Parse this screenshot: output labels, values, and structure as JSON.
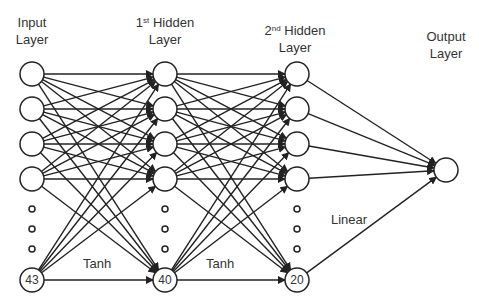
{
  "diagram": {
    "type": "feedforward-neural-network",
    "layers": [
      {
        "id": "input",
        "title_line1": "Input",
        "title_line2": "Layer",
        "nodes": 43,
        "last_node_label": "43"
      },
      {
        "id": "hidden1",
        "title_ordinal": "1",
        "title_sup": "st",
        "title_rest": " Hidden",
        "title_line2": "Layer",
        "nodes": 40,
        "last_node_label": "40"
      },
      {
        "id": "hidden2",
        "title_ordinal": "2",
        "title_sup": "nd",
        "title_rest": " Hidden",
        "title_line2": "Layer",
        "nodes": 20,
        "last_node_label": "20"
      },
      {
        "id": "output",
        "title_line1": "Output",
        "title_line2": "Layer",
        "nodes": 1
      }
    ],
    "activations": {
      "input_to_hidden1": "Tanh",
      "hidden1_to_hidden2": "Tanh",
      "hidden2_to_output": "Linear"
    },
    "colors": {
      "stroke": "#222222",
      "text": "#333333",
      "background": "#ffffff"
    }
  }
}
